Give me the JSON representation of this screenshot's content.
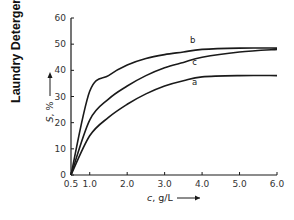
{
  "side_title": "Laundry Detergents",
  "chart_data": {
    "type": "line",
    "title": "",
    "xlabel": "c, g/L",
    "ylabel": "S, %",
    "xlim": [
      0.5,
      6.0
    ],
    "ylim": [
      0,
      60
    ],
    "x_ticks": [
      "0.5",
      "1.0",
      "2.0",
      "3.0",
      "4.0",
      "5.0",
      "6.0"
    ],
    "y_ticks": [
      "0",
      "10",
      "20",
      "30",
      "40",
      "50",
      "60"
    ],
    "grid": false,
    "legend": "inline curve labels",
    "x": [
      0.5,
      1.0,
      1.5,
      2.0,
      2.5,
      3.0,
      3.5,
      4.0,
      5.0,
      6.0
    ],
    "series": [
      {
        "name": "a",
        "values": [
          0,
          15,
          22,
          27,
          31,
          34,
          36,
          37.5,
          38,
          38
        ]
      },
      {
        "name": "b",
        "values": [
          0,
          32,
          38,
          42,
          44.5,
          46,
          47,
          48,
          48.5,
          48.5
        ]
      },
      {
        "name": "c",
        "values": [
          0,
          21,
          29,
          34,
          38,
          41,
          43,
          45,
          47,
          48
        ]
      }
    ],
    "curve_labels": {
      "a": "a",
      "b": "b",
      "c": "c"
    }
  }
}
